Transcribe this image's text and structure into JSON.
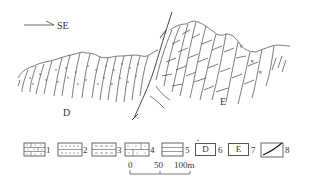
{
  "diagram": {
    "type": "geological cross-section",
    "direction_label": "SE",
    "unit_labels": {
      "left": "D",
      "right": "E"
    },
    "legend": [
      {
        "id": 1,
        "number": "1",
        "pattern": "dotted-brick"
      },
      {
        "id": 2,
        "number": "2",
        "pattern": "dotted-dashes"
      },
      {
        "id": 3,
        "number": "3",
        "pattern": "dashes"
      },
      {
        "id": 4,
        "number": "4",
        "pattern": "dotted-blocks"
      },
      {
        "id": 5,
        "number": "5",
        "pattern": "horizontal-lines"
      },
      {
        "id": 6,
        "number": "6",
        "box_text": "D"
      },
      {
        "id": 7,
        "number": "7",
        "box_text": "E"
      },
      {
        "id": 8,
        "number": "8",
        "pattern": "fault-line"
      }
    ],
    "scale_bar": {
      "ticks": [
        "0",
        "50",
        "100m"
      ]
    }
  }
}
